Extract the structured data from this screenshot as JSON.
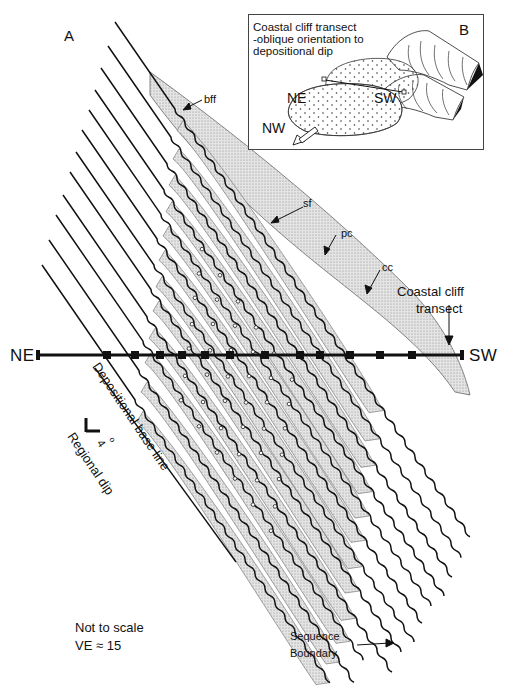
{
  "figure": {
    "panel_a_label": "A",
    "panel_b_label": "B",
    "labels": {
      "bff": "bff",
      "sf": "sf",
      "pc": "pc",
      "cc": "cc",
      "coastal_cliff_transect_line1": "Coastal cliff",
      "coastal_cliff_transect_line2": "transect",
      "ne": "NE",
      "sw": "SW",
      "depositional_base_line": "Depositional base line",
      "regional_dip_angle": "4",
      "regional_dip_degree": "o",
      "regional_dip": "Regional dip",
      "not_to_scale": "Not to scale",
      "ve": "VE ≈ 15",
      "sequence_boundary_line1": "Sequence",
      "sequence_boundary_line2": "Boundary"
    },
    "inset": {
      "title_line1": "Coastal cliff transect",
      "title_line2": "-oblique orientation to",
      "title_line3": "depositional dip",
      "ne": "NE",
      "sw": "SW",
      "nw": "NW"
    },
    "colors": {
      "ink": "#111111",
      "shade": "#d4d4d4",
      "background": "#ffffff"
    }
  }
}
